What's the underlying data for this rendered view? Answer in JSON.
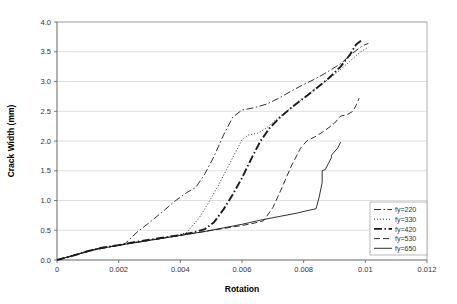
{
  "chart_data": {
    "type": "line",
    "title": "",
    "xlabel": "Rotation",
    "ylabel": "Crack Width (mm)",
    "xlim": [
      0,
      0.012
    ],
    "ylim": [
      0,
      4.0
    ],
    "xticks": [
      0,
      0.002,
      0.004,
      0.006,
      0.008,
      0.01,
      0.012
    ],
    "xtick_labels": [
      "0",
      "0.002",
      "0.004",
      "0.006",
      "0.008",
      "0.01",
      "0.012"
    ],
    "yticks": [
      0,
      0.5,
      1.0,
      1.5,
      2.0,
      2.5,
      3.0,
      3.5,
      4.0
    ],
    "ytick_labels": [
      "0.0",
      "0.5",
      "1.0",
      "1.5",
      "2.0",
      "2.5",
      "3.0",
      "3.5",
      "4.0"
    ],
    "grid": "horizontal",
    "legend_position": "bottom-right",
    "series": [
      {
        "name": "fy=220",
        "dash": "dashdot",
        "width": 0.9,
        "points": [
          [
            0.0,
            0.0
          ],
          [
            0.0004,
            0.06
          ],
          [
            0.0008,
            0.12
          ],
          [
            0.0011,
            0.17
          ],
          [
            0.0014,
            0.2
          ],
          [
            0.0018,
            0.23
          ],
          [
            0.0022,
            0.27
          ],
          [
            0.0026,
            0.47
          ],
          [
            0.003,
            0.63
          ],
          [
            0.0034,
            0.8
          ],
          [
            0.0038,
            0.98
          ],
          [
            0.0042,
            1.13
          ],
          [
            0.0045,
            1.22
          ],
          [
            0.0048,
            1.45
          ],
          [
            0.0051,
            1.75
          ],
          [
            0.0054,
            2.1
          ],
          [
            0.0057,
            2.4
          ],
          [
            0.006,
            2.52
          ],
          [
            0.0064,
            2.56
          ],
          [
            0.0068,
            2.62
          ],
          [
            0.0072,
            2.72
          ],
          [
            0.0076,
            2.84
          ],
          [
            0.008,
            2.95
          ],
          [
            0.0084,
            3.05
          ],
          [
            0.0088,
            3.17
          ],
          [
            0.0092,
            3.3
          ],
          [
            0.0096,
            3.48
          ],
          [
            0.0099,
            3.6
          ],
          [
            0.0101,
            3.64
          ]
        ]
      },
      {
        "name": "fy=330",
        "dash": "dotted",
        "width": 0.9,
        "points": [
          [
            0.0,
            0.0
          ],
          [
            0.0005,
            0.07
          ],
          [
            0.001,
            0.15
          ],
          [
            0.0014,
            0.2
          ],
          [
            0.0019,
            0.24
          ],
          [
            0.0024,
            0.29
          ],
          [
            0.0029,
            0.33
          ],
          [
            0.0034,
            0.37
          ],
          [
            0.0038,
            0.4
          ],
          [
            0.0042,
            0.46
          ],
          [
            0.0046,
            0.7
          ],
          [
            0.0049,
            0.95
          ],
          [
            0.0052,
            1.22
          ],
          [
            0.0055,
            1.52
          ],
          [
            0.0058,
            1.82
          ],
          [
            0.006,
            2.02
          ],
          [
            0.0062,
            2.1
          ],
          [
            0.0065,
            2.13
          ],
          [
            0.0068,
            2.22
          ],
          [
            0.0071,
            2.36
          ],
          [
            0.0075,
            2.52
          ],
          [
            0.0079,
            2.68
          ],
          [
            0.0083,
            2.85
          ],
          [
            0.0087,
            3.0
          ],
          [
            0.0091,
            3.16
          ],
          [
            0.0095,
            3.34
          ],
          [
            0.0098,
            3.48
          ],
          [
            0.0101,
            3.58
          ]
        ]
      },
      {
        "name": "fy=420",
        "dash": "dashdot-bold",
        "width": 1.9,
        "points": [
          [
            0.0,
            0.0
          ],
          [
            0.0005,
            0.07
          ],
          [
            0.001,
            0.15
          ],
          [
            0.0015,
            0.21
          ],
          [
            0.002,
            0.25
          ],
          [
            0.0025,
            0.3
          ],
          [
            0.003,
            0.34
          ],
          [
            0.0035,
            0.38
          ],
          [
            0.004,
            0.42
          ],
          [
            0.0044,
            0.46
          ],
          [
            0.0048,
            0.52
          ],
          [
            0.0051,
            0.64
          ],
          [
            0.0054,
            0.85
          ],
          [
            0.0057,
            1.1
          ],
          [
            0.006,
            1.38
          ],
          [
            0.0063,
            1.7
          ],
          [
            0.0066,
            2.0
          ],
          [
            0.0069,
            2.22
          ],
          [
            0.0072,
            2.38
          ],
          [
            0.0076,
            2.56
          ],
          [
            0.008,
            2.72
          ],
          [
            0.0084,
            2.88
          ],
          [
            0.0088,
            3.05
          ],
          [
            0.0092,
            3.25
          ],
          [
            0.0095,
            3.45
          ],
          [
            0.0097,
            3.62
          ],
          [
            0.0099,
            3.7
          ]
        ]
      },
      {
        "name": "fy=530",
        "dash": "dashed",
        "width": 0.9,
        "points": [
          [
            0.0,
            0.0
          ],
          [
            0.0006,
            0.08
          ],
          [
            0.0012,
            0.17
          ],
          [
            0.0018,
            0.23
          ],
          [
            0.0024,
            0.28
          ],
          [
            0.003,
            0.33
          ],
          [
            0.0036,
            0.38
          ],
          [
            0.0042,
            0.43
          ],
          [
            0.0048,
            0.48
          ],
          [
            0.0054,
            0.53
          ],
          [
            0.006,
            0.58
          ],
          [
            0.0064,
            0.62
          ],
          [
            0.0067,
            0.66
          ],
          [
            0.007,
            0.88
          ],
          [
            0.0073,
            1.22
          ],
          [
            0.0076,
            1.58
          ],
          [
            0.0079,
            1.88
          ],
          [
            0.0081,
            2.0
          ],
          [
            0.0084,
            2.08
          ],
          [
            0.0087,
            2.18
          ],
          [
            0.009,
            2.3
          ],
          [
            0.0092,
            2.42
          ],
          [
            0.0094,
            2.44
          ],
          [
            0.0096,
            2.5
          ],
          [
            0.0097,
            2.6
          ],
          [
            0.0098,
            2.72
          ]
        ]
      },
      {
        "name": "fy=650",
        "dash": "solid",
        "width": 0.9,
        "points": [
          [
            0.0,
            0.0
          ],
          [
            0.0006,
            0.09
          ],
          [
            0.0012,
            0.17
          ],
          [
            0.0018,
            0.23
          ],
          [
            0.0024,
            0.28
          ],
          [
            0.003,
            0.33
          ],
          [
            0.0036,
            0.38
          ],
          [
            0.0042,
            0.43
          ],
          [
            0.0048,
            0.48
          ],
          [
            0.0054,
            0.54
          ],
          [
            0.006,
            0.6
          ],
          [
            0.0066,
            0.67
          ],
          [
            0.0072,
            0.73
          ],
          [
            0.0078,
            0.79
          ],
          [
            0.0082,
            0.84
          ],
          [
            0.0084,
            0.86
          ],
          [
            0.0085,
            1.05
          ],
          [
            0.0086,
            1.3
          ],
          [
            0.0086,
            1.5
          ],
          [
            0.0087,
            1.52
          ],
          [
            0.0088,
            1.62
          ],
          [
            0.0089,
            1.72
          ],
          [
            0.0089,
            1.76
          ],
          [
            0.0091,
            1.88
          ],
          [
            0.0092,
            1.98
          ]
        ]
      }
    ]
  },
  "legend": {
    "entries": [
      {
        "label": "fy=220"
      },
      {
        "label": "fy=330"
      },
      {
        "label": "fy=420"
      },
      {
        "label": "fy=530"
      },
      {
        "label": "fy=650"
      }
    ]
  }
}
